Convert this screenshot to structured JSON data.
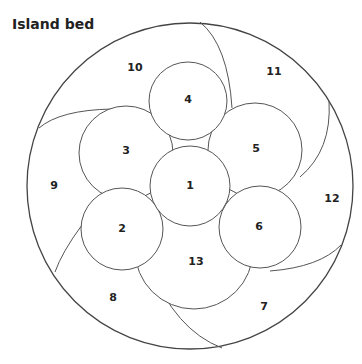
{
  "title": "Island bed",
  "regions": [
    {
      "id": "1",
      "label": "1",
      "x": 190,
      "y": 186
    },
    {
      "id": "2",
      "label": "2",
      "x": 122,
      "y": 229
    },
    {
      "id": "3",
      "label": "3",
      "x": 126,
      "y": 151
    },
    {
      "id": "4",
      "label": "4",
      "x": 188,
      "y": 100
    },
    {
      "id": "5",
      "label": "5",
      "x": 256,
      "y": 149
    },
    {
      "id": "6",
      "label": "6",
      "x": 259,
      "y": 227
    },
    {
      "id": "7",
      "label": "7",
      "x": 264,
      "y": 307
    },
    {
      "id": "8",
      "label": "8",
      "x": 113,
      "y": 298
    },
    {
      "id": "9",
      "label": "9",
      "x": 54,
      "y": 186
    },
    {
      "id": "10",
      "label": "10",
      "x": 135,
      "y": 68
    },
    {
      "id": "11",
      "label": "11",
      "x": 274,
      "y": 72
    },
    {
      "id": "12",
      "label": "12",
      "x": 332,
      "y": 199
    },
    {
      "id": "13",
      "label": "13",
      "x": 196,
      "y": 262
    }
  ]
}
